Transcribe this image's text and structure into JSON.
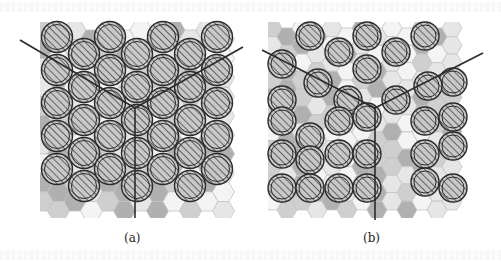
{
  "figure": {
    "panels": [
      {
        "id": "a",
        "label": "(a)",
        "packing": "dense, overlapping disks"
      },
      {
        "id": "b",
        "label": "(b)",
        "packing": "sparse disks on visible hexagonal grid"
      }
    ]
  },
  "colors": {
    "ink": "#2b2b2b",
    "hatch": "#555555",
    "disk_fill": "#bdbdbd",
    "hex_light": "#e6e6e6",
    "hex_mid": "#cfcfcf",
    "hex_dark": "#b0b0b0",
    "hex_stroke": "#c4c4c4",
    "background": "#ffffff"
  }
}
